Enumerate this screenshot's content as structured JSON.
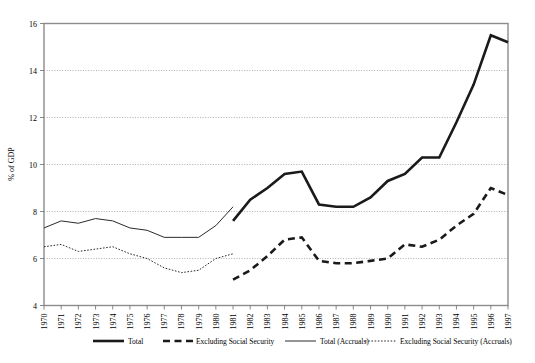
{
  "chart_data": {
    "type": "line",
    "title": "",
    "xlabel": "",
    "ylabel": "% of GDP",
    "ylim": [
      4,
      16
    ],
    "xlim": [
      1970,
      1997
    ],
    "yticks": [
      4,
      6,
      8,
      10,
      12,
      14,
      16
    ],
    "grid": true,
    "legend_position": "bottom",
    "categories": [
      1970,
      1971,
      1972,
      1973,
      1974,
      1975,
      1976,
      1977,
      1978,
      1979,
      1980,
      1981,
      1982,
      1983,
      1984,
      1985,
      1986,
      1987,
      1988,
      1989,
      1990,
      1991,
      1992,
      1993,
      1994,
      1995,
      1996,
      1997
    ],
    "series": [
      {
        "name": "Total",
        "style": "thick-solid",
        "x": [
          1981,
          1982,
          1983,
          1984,
          1985,
          1986,
          1987,
          1988,
          1989,
          1990,
          1991,
          1992,
          1993,
          1994,
          1995,
          1996,
          1997
        ],
        "values": [
          7.6,
          8.5,
          9.0,
          9.6,
          9.7,
          8.3,
          8.2,
          8.2,
          8.6,
          9.3,
          9.6,
          10.3,
          10.3,
          11.8,
          13.4,
          15.5,
          15.2
        ]
      },
      {
        "name": "Excluding Social Security",
        "style": "thick-dashed",
        "x": [
          1981,
          1982,
          1983,
          1984,
          1985,
          1986,
          1987,
          1988,
          1989,
          1990,
          1991,
          1992,
          1993,
          1994,
          1995,
          1996,
          1997
        ],
        "values": [
          5.1,
          5.5,
          6.1,
          6.8,
          6.9,
          5.9,
          5.8,
          5.8,
          5.9,
          6.0,
          6.6,
          6.5,
          6.8,
          7.4,
          7.9,
          9.0,
          8.7
        ]
      },
      {
        "name": "Total (Accruals)",
        "style": "thin-solid",
        "x": [
          1970,
          1971,
          1972,
          1973,
          1974,
          1975,
          1976,
          1977,
          1978,
          1979,
          1980,
          1981
        ],
        "values": [
          7.3,
          7.6,
          7.5,
          7.7,
          7.6,
          7.3,
          7.2,
          6.9,
          6.9,
          6.9,
          7.4,
          8.2
        ]
      },
      {
        "name": "Excluding Social Security (Accruals)",
        "style": "thin-dotted",
        "x": [
          1970,
          1971,
          1972,
          1973,
          1974,
          1975,
          1976,
          1977,
          1978,
          1979,
          1980,
          1981
        ],
        "values": [
          6.5,
          6.6,
          6.3,
          6.4,
          6.5,
          6.2,
          6.0,
          5.6,
          5.4,
          5.5,
          6.0,
          6.2
        ]
      }
    ]
  },
  "axes": {
    "ylabel": "% of GDP",
    "ytick_labels": [
      "4",
      "6",
      "8",
      "10",
      "12",
      "14",
      "16"
    ],
    "xtick_labels": [
      "1970",
      "1971",
      "1972",
      "1973",
      "1974",
      "1975",
      "1976",
      "1977",
      "1978",
      "1979",
      "1980",
      "1981",
      "1982",
      "1983",
      "1984",
      "1985",
      "1986",
      "1987",
      "1988",
      "1989",
      "1990",
      "1991",
      "1992",
      "1993",
      "1994",
      "1995",
      "1996",
      "1997"
    ]
  },
  "legend": {
    "items": [
      {
        "label": "Total",
        "style": "thick-solid"
      },
      {
        "label": "Excluding Social Security",
        "style": "thick-dashed"
      },
      {
        "label": "Total (Accruals)",
        "style": "thin-solid"
      },
      {
        "label": "Excluding Social Security (Accruals)",
        "style": "thin-dotted"
      }
    ]
  },
  "colors": {
    "line": "#1a1a1a",
    "grid": "#9a9a9a",
    "frame": "#8c8c8c",
    "background": "#ffffff"
  }
}
